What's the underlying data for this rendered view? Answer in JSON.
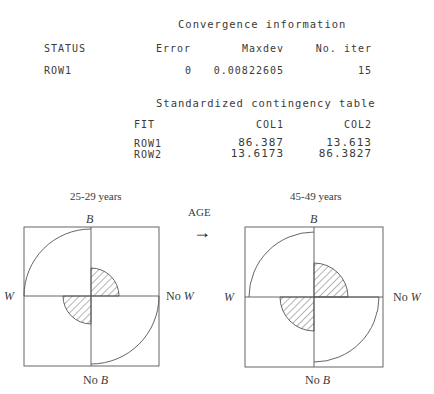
{
  "convergence": {
    "title": "Convergence information",
    "headers": [
      "STATUS",
      "Error",
      "Maxdev",
      "No. iter"
    ],
    "rows": [
      {
        "label": "ROW1",
        "error": "0",
        "maxdev": "0.00822605",
        "iter": "15"
      }
    ]
  },
  "contingency": {
    "title": "Standardized contingency table",
    "headers": [
      "FIT",
      "COL1",
      "COL2"
    ],
    "rows": [
      {
        "label": "ROW1",
        "col1": "86.387",
        "col2": "13.613"
      },
      {
        "label": "ROW2",
        "col1": "13.6173",
        "col2": "86.3827"
      }
    ]
  },
  "diagram": {
    "arrow_label": "AGE",
    "arrow_glyph": "→",
    "panels": [
      {
        "title": "25-29 years",
        "top": "B",
        "bottom_prefix": "No ",
        "bottom_var": "B",
        "left": "W",
        "right_prefix": "No ",
        "right_var": "W",
        "large_radius": 67,
        "small_radius": 28
      },
      {
        "title": "45-49 years",
        "top": "B",
        "bottom_prefix": "No ",
        "bottom_var": "B",
        "left": "W",
        "right_prefix": "No ",
        "right_var": "W",
        "large_radius": 65,
        "small_radius": 34
      }
    ]
  }
}
